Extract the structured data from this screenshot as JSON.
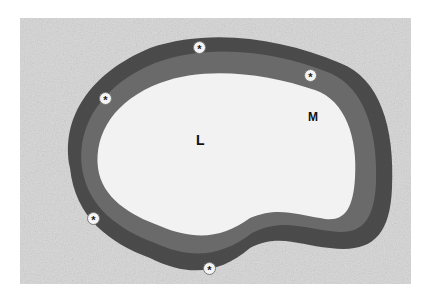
{
  "figure": {
    "labels": {
      "lumen": "L",
      "media": "M"
    },
    "markers": [
      {
        "symbol": "*",
        "x": 199,
        "y": 47
      },
      {
        "symbol": "*",
        "x": 310,
        "y": 75
      },
      {
        "symbol": "*",
        "x": 105,
        "y": 98
      },
      {
        "symbol": "*",
        "x": 93,
        "y": 218
      },
      {
        "symbol": "*",
        "x": 209,
        "y": 268
      }
    ],
    "colors": {
      "background": "#ffffff",
      "tissue_light": "#d9d9d9",
      "wall_dark": "#2a2a2a",
      "media_mid": "#6e6e6e",
      "lumen": "#f2f2f2"
    }
  }
}
